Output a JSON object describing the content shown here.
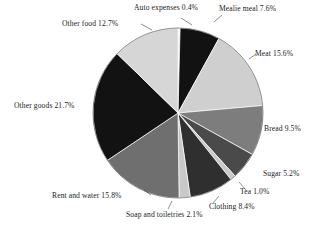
{
  "chart_data": {
    "type": "pie",
    "title": "",
    "subtitle": "",
    "xlabel": "",
    "ylabel": "",
    "legend_position": "none",
    "grid": false,
    "value_unit": "percent",
    "start_angle_deg": 0,
    "direction": "clockwise",
    "categories": [
      "Auto expenses",
      "Mealie meal",
      "Meat",
      "Bread",
      "Sugar",
      "Tea",
      "Clothing",
      "Soap and toiletries",
      "Rent and water",
      "Other goods",
      "Other food"
    ],
    "values": [
      0.4,
      7.6,
      15.6,
      9.5,
      5.2,
      1.0,
      8.4,
      2.1,
      15.8,
      21.7,
      12.7
    ],
    "slice_colors": [
      "#f2f2f2",
      "#121212",
      "#cfcfcf",
      "#7d7d7d",
      "#4a4a4a",
      "#c9c9c9",
      "#2f2f2f",
      "#c9c9c9",
      "#6f6f6f",
      "#121212",
      "#d6d6d6"
    ],
    "slices": [
      {
        "label": "Auto expenses",
        "value": 0.4,
        "text": "Auto expenses 0.4%",
        "color": "#f2f2f2"
      },
      {
        "label": "Mealie meal",
        "value": 7.6,
        "text": "Mealie meal 7.6%",
        "color": "#121212"
      },
      {
        "label": "Meat",
        "value": 15.6,
        "text": "Meat 15.6%",
        "color": "#cfcfcf"
      },
      {
        "label": "Bread",
        "value": 9.5,
        "text": "Bread 9.5%",
        "color": "#7d7d7d"
      },
      {
        "label": "Sugar",
        "value": 5.2,
        "text": "Sugar 5.2%",
        "color": "#4a4a4a"
      },
      {
        "label": "Tea",
        "value": 1.0,
        "text": "Tea 1.0%",
        "color": "#c9c9c9"
      },
      {
        "label": "Clothing",
        "value": 8.4,
        "text": "Clothing 8.4%",
        "color": "#2f2f2f"
      },
      {
        "label": "Soap and toiletries",
        "value": 2.1,
        "text": "Soap and toiletries 2.1%",
        "color": "#c9c9c9"
      },
      {
        "label": "Rent and water",
        "value": 15.8,
        "text": "Rent and water 15.8%",
        "color": "#6f6f6f"
      },
      {
        "label": "Other goods",
        "value": 21.7,
        "text": "Other goods 21.7%",
        "color": "#121212"
      },
      {
        "label": "Other food",
        "value": 12.7,
        "text": "Other food 12.7%",
        "color": "#d6d6d6"
      }
    ]
  },
  "labels": {
    "auto_expenses": "Auto expenses 0.4%",
    "mealie_meal": "Mealie meal 7.6%",
    "meat": "Meat 15.6%",
    "bread": "Bread 9.5%",
    "sugar": "Sugar 5.2%",
    "tea": "Tea 1.0%",
    "clothing": "Clothing 8.4%",
    "soap_and_toiletries": "Soap and toiletries 2.1%",
    "rent_and_water": "Rent and water 15.8%",
    "other_goods": "Other goods 21.7%",
    "other_food": "Other food 12.7%"
  },
  "geometry": {
    "center_x": 178,
    "center_y": 113,
    "radius": 85
  },
  "colors": {
    "background": "#ffffff",
    "text": "#1b1b1b",
    "outline": "#4a4a4a"
  }
}
